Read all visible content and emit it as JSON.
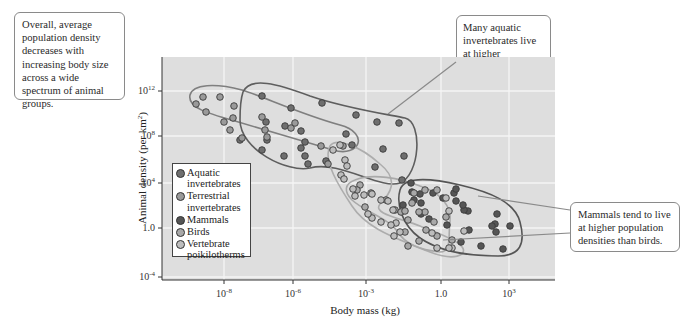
{
  "chart_data": {
    "type": "scatter",
    "title": "",
    "xlabel": "Body mass (kg)",
    "ylabel": "Animal density (per km²)",
    "x_scale": "log",
    "y_scale": "log",
    "xlim": [
      1e-10,
      100000.0
    ],
    "ylim": [
      0.0001,
      100000000000000.0
    ],
    "grid": true,
    "legend_position": "inside-lower-left",
    "x_ticks": [
      {
        "label_base": "10",
        "label_exp": "-8",
        "value": 1e-08
      },
      {
        "label_base": "10",
        "label_exp": "-6",
        "value": 1e-06
      },
      {
        "label_base": "10",
        "label_exp": "-3",
        "value": 0.001
      },
      {
        "label_base": "1.0",
        "label_exp": "",
        "value": 1
      },
      {
        "label_base": "10",
        "label_exp": "3",
        "value": 1000.0
      }
    ],
    "y_ticks": [
      {
        "label_base": "10",
        "label_exp": "12",
        "value": 1000000000000.0
      },
      {
        "label_base": "10",
        "label_exp": "8",
        "value": 100000000.0
      },
      {
        "label_base": "10",
        "label_exp": "4",
        "value": 10000.0
      },
      {
        "label_base": "1.0",
        "label_exp": "",
        "value": 1
      },
      {
        "label_base": "10",
        "label_exp": "-4",
        "value": 0.0001
      }
    ],
    "series": [
      {
        "name": "Aquatic invertebrates",
        "color": "#6e6e6e",
        "points_px": [
          [
            262,
            96
          ],
          [
            291,
            108
          ],
          [
            322,
            103
          ],
          [
            356,
            115
          ],
          [
            377,
            122
          ],
          [
            399,
            123
          ],
          [
            285,
            126
          ],
          [
            301,
            131
          ],
          [
            266,
            122
          ],
          [
            267,
            140
          ],
          [
            346,
            134
          ],
          [
            352,
            145
          ],
          [
            383,
            149
          ],
          [
            404,
            156
          ],
          [
            375,
            167
          ],
          [
            402,
            180
          ],
          [
            308,
            164
          ],
          [
            326,
            161
          ],
          [
            301,
            148
          ],
          [
            284,
            156
          ],
          [
            305,
            156
          ],
          [
            305,
            142
          ],
          [
            240,
            140
          ],
          [
            262,
            150
          ]
        ]
      },
      {
        "name": "Terrestrial invertebrates",
        "color": "#9a9a9a",
        "points_px": [
          [
            196,
            104
          ],
          [
            203,
            97
          ],
          [
            220,
            97
          ],
          [
            206,
            112
          ],
          [
            234,
            106
          ],
          [
            224,
            122
          ],
          [
            233,
            118
          ],
          [
            230,
            130
          ],
          [
            242,
            138
          ],
          [
            262,
            117
          ],
          [
            265,
            130
          ],
          [
            267,
            137
          ],
          [
            291,
            128
          ],
          [
            295,
            123
          ],
          [
            321,
            146
          ],
          [
            343,
            146
          ],
          [
            328,
            164
          ]
        ]
      },
      {
        "name": "Mammals",
        "color": "#555555",
        "points_px": [
          [
            411,
            183
          ],
          [
            412,
            192
          ],
          [
            420,
            194
          ],
          [
            403,
            205
          ],
          [
            414,
            200
          ],
          [
            421,
            203
          ],
          [
            433,
            193
          ],
          [
            456,
            201
          ],
          [
            454,
            193
          ],
          [
            468,
            211
          ],
          [
            464,
            210
          ],
          [
            456,
            189
          ],
          [
            463,
            205
          ],
          [
            497,
            214
          ],
          [
            495,
            224
          ],
          [
            496,
            232
          ],
          [
            492,
            226
          ],
          [
            510,
            226
          ],
          [
            447,
            225
          ],
          [
            469,
            230
          ],
          [
            461,
            242
          ],
          [
            481,
            246
          ],
          [
            503,
            249
          ],
          [
            421,
            214
          ],
          [
            429,
            219
          ],
          [
            443,
            198
          ]
        ]
      },
      {
        "name": "Birds",
        "color": "#a8a8a8",
        "points_px": [
          [
            360,
            185
          ],
          [
            357,
            190
          ],
          [
            371,
            193
          ],
          [
            365,
            207
          ],
          [
            386,
            200
          ],
          [
            395,
            210
          ],
          [
            401,
            212
          ],
          [
            425,
            190
          ],
          [
            437,
            190
          ],
          [
            414,
            193
          ],
          [
            412,
            203
          ],
          [
            425,
            212
          ],
          [
            419,
            212
          ],
          [
            405,
            211
          ],
          [
            408,
            220
          ],
          [
            426,
            230
          ],
          [
            446,
            217
          ],
          [
            434,
            222
          ],
          [
            437,
            236
          ],
          [
            452,
            240
          ],
          [
            405,
            232
          ],
          [
            408,
            246
          ],
          [
            419,
            241
          ]
        ]
      },
      {
        "name": "Vertebrate poikilotherms",
        "color": "#bdbdbd",
        "points_px": [
          [
            333,
            150
          ],
          [
            340,
            145
          ],
          [
            345,
            160
          ],
          [
            347,
            166
          ],
          [
            341,
            175
          ],
          [
            344,
            179
          ],
          [
            364,
            195
          ],
          [
            355,
            196
          ],
          [
            353,
            189
          ],
          [
            372,
            194
          ],
          [
            381,
            200
          ],
          [
            388,
            201
          ],
          [
            393,
            210
          ],
          [
            396,
            223
          ],
          [
            372,
            218
          ],
          [
            381,
            222
          ],
          [
            391,
            225
          ],
          [
            368,
            214
          ],
          [
            446,
            198
          ],
          [
            449,
            211
          ],
          [
            400,
            232
          ],
          [
            432,
            233
          ],
          [
            437,
            248
          ],
          [
            452,
            248
          ],
          [
            449,
            248
          ],
          [
            464,
            231
          ],
          [
            394,
            236
          ]
        ]
      }
    ],
    "regions": [
      {
        "name": "Terrestrial invertebrates",
        "stroke": "#7a7a7a"
      },
      {
        "name": "Aquatic invertebrates",
        "stroke": "#5e5e5e"
      },
      {
        "name": "Birds",
        "stroke": "#a9a9a9"
      },
      {
        "name": "Vertebrate poikilotherms",
        "stroke": "#a9a9a9"
      },
      {
        "name": "Mammals",
        "stroke": "#555555"
      }
    ],
    "annotations": [
      "Overall, average population density decreases with increasing body size across a wide spectrum of animal groups.",
      "Many aquatic invertebrates live at higher population densities than other animals of comparable size.",
      "Mammals tend to live at higher population densities than birds."
    ]
  },
  "callouts": {
    "left": "Overall, average population density decreases with increasing body size across a wide spectrum of animal groups.",
    "top": "Many aquatic invertebrates live at higher population densities than other animals of comparable size.",
    "right": "Mammals tend to live at higher population densities than birds."
  },
  "legend": {
    "items": [
      {
        "label": "Aquatic\ninvertebrates",
        "color": "#6e6e6e"
      },
      {
        "label": "Terrestrial\ninvertebrates",
        "color": "#9a9a9a"
      },
      {
        "label": "Mammals",
        "color": "#555555"
      },
      {
        "label": "Birds",
        "color": "#a8a8a8"
      },
      {
        "label": "Vertebrate\npoikilotherms",
        "color": "#bdbdbd"
      }
    ]
  },
  "axes": {
    "xlabel": "Body mass (kg)",
    "ylabel_main": "Animal density (per km",
    "ylabel_sup": "2",
    "ylabel_end": ")"
  },
  "colors": {
    "plot_bg": "#dedede",
    "grid": "#f4f4f4",
    "axis": "#333333",
    "leader_line": "#8a8a8a"
  }
}
